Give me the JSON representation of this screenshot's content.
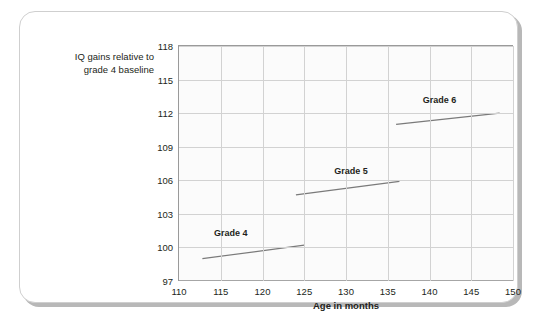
{
  "chart_data": {
    "type": "line",
    "title": "",
    "xlabel": "Age in months",
    "ylabel": "IQ gains relative to grade 4 baseline",
    "xlim": [
      110,
      150
    ],
    "ylim": [
      97,
      118
    ],
    "xticks": [
      110,
      115,
      120,
      125,
      130,
      135,
      140,
      145,
      150
    ],
    "yticks": [
      97,
      100,
      103,
      106,
      109,
      112,
      115,
      118
    ],
    "grid": true,
    "legend": "inline-annotations",
    "series": [
      {
        "name": "Grade 4",
        "label": "Grade 4",
        "label_x": 116.2,
        "label_y": 101.3,
        "x": [
          112.8,
          125.0
        ],
        "y": [
          99.0,
          100.2
        ],
        "color": "#7a7a7a"
      },
      {
        "name": "Grade 5",
        "label": "Grade 5",
        "label_x": 130.6,
        "label_y": 106.8,
        "x": [
          124.0,
          136.4
        ],
        "y": [
          104.7,
          105.9
        ],
        "color": "#7a7a7a"
      },
      {
        "name": "Grade 6",
        "label": "Grade 6",
        "label_x": 141.2,
        "label_y": 113.2,
        "x": [
          136.0,
          148.4
        ],
        "y": [
          111.0,
          112.0
        ],
        "color": "#7a7a7a"
      }
    ]
  },
  "axes": {
    "y_title_line1": "IQ gains relative to",
    "y_title_line2": "grade 4 baseline",
    "x_title": "Age in months"
  },
  "colors": {
    "line": "#7a7a7a",
    "grid": "#d2d2d2",
    "axis": "#9a9a9a",
    "text": "#231f20",
    "plot_background": "#fbfbfb",
    "card_background": "#ffffff",
    "card_shadow": "#b8b8b8"
  }
}
